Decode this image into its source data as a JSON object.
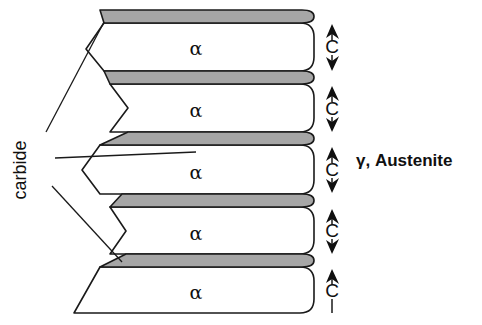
{
  "figure": {
    "background_color": "#ffffff",
    "line_color": "#1a1a1a",
    "carbide_fill_color": "#a6a6a6",
    "ferrite_fill_color": "#ffffff",
    "width": 482,
    "height": 325
  },
  "labels": {
    "carbide": "carbide",
    "austenite": "γ, Austenite",
    "ferrite_phase": "α",
    "carbon_flux": "C"
  },
  "ferrite_lamellae": [
    {
      "id": "alpha-1",
      "label": "α",
      "cx": 196,
      "cy": 48
    },
    {
      "id": "alpha-2",
      "label": "α",
      "cx": 196,
      "cy": 110
    },
    {
      "id": "alpha-3",
      "label": "α",
      "cx": 196,
      "cy": 172
    },
    {
      "id": "alpha-4",
      "label": "α",
      "cx": 196,
      "cy": 233
    },
    {
      "id": "alpha-5",
      "label": "α",
      "cx": 196,
      "cy": 292
    }
  ],
  "carbide_lamellae": [
    {
      "id": "carbide-1",
      "y_top": 10,
      "y_bottom": 23
    },
    {
      "id": "carbide-2",
      "y_top": 71,
      "y_bottom": 84
    },
    {
      "id": "carbide-3",
      "y_top": 132,
      "y_bottom": 145
    },
    {
      "id": "carbide-4",
      "y_top": 194,
      "y_bottom": 207
    },
    {
      "id": "carbide-5",
      "y_top": 254,
      "y_bottom": 267
    }
  ],
  "carbon_arrows": [
    {
      "id": "c-arrow-1",
      "label": "C",
      "x": 332,
      "y_top": 26,
      "y_bottom": 69,
      "label_y": 48
    },
    {
      "id": "c-arrow-2",
      "label": "C",
      "x": 332,
      "y_top": 88,
      "y_bottom": 130,
      "label_y": 110
    },
    {
      "id": "c-arrow-3",
      "label": "C",
      "x": 332,
      "y_top": 149,
      "y_bottom": 191,
      "label_y": 171
    },
    {
      "id": "c-arrow-4",
      "label": "C",
      "x": 332,
      "y_top": 211,
      "y_bottom": 252,
      "label_y": 232
    },
    {
      "id": "c-arrow-5",
      "label": "C",
      "x": 332,
      "y_top": 271,
      "y_bottom": 313,
      "label_y": 292
    }
  ],
  "carbide_leaders": [
    {
      "id": "leader-top",
      "path": "M 46,132 L 104,22"
    },
    {
      "id": "leader-middle",
      "path": "M 55,158 L 196,152"
    },
    {
      "id": "leader-bottom",
      "path": "M 52,186 L 122,262"
    }
  ],
  "carbide_label_position": {
    "x": 26,
    "y": 170,
    "rotation": -90
  },
  "austenite_label_position": {
    "x": 356,
    "y": 166
  }
}
